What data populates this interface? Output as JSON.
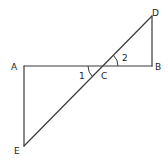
{
  "diagram": {
    "type": "geometry",
    "points": {
      "A": {
        "label": "A",
        "x": 24,
        "y": 66
      },
      "B": {
        "label": "B",
        "x": 152,
        "y": 66
      },
      "C": {
        "label": "C",
        "x": 103,
        "y": 66
      },
      "D": {
        "label": "D",
        "x": 152,
        "y": 16
      },
      "E": {
        "label": "E",
        "x": 24,
        "y": 146
      }
    },
    "segments": [
      "AB",
      "BD",
      "AE",
      "DE"
    ],
    "angles": [
      {
        "label": "1",
        "vertex": "C",
        "between": [
          "A",
          "E"
        ]
      },
      {
        "label": "2",
        "vertex": "C",
        "between": [
          "B",
          "D"
        ]
      }
    ],
    "stroke_color": "#3a3a3a"
  }
}
